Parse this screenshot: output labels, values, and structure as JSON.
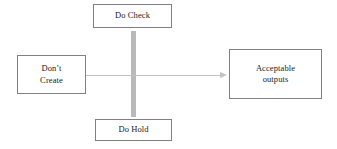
{
  "diagram": {
    "background_color": "#ffffff",
    "box_border_color": "#808080",
    "arrow_color": "#c2c2c2",
    "bar_color": "#b9b9b9",
    "nodes": {
      "top": {
        "name": "Do Check",
        "lines": [
          "Do Check"
        ]
      },
      "left": {
        "name": "Don't Create",
        "lines": [
          "Don’t",
          "Create"
        ]
      },
      "right": {
        "name": "Acceptable outputs",
        "lines": [
          "Acceptable",
          "outputs"
        ]
      },
      "bottom": {
        "name": "Do Hold",
        "lines": [
          "Do Hold"
        ]
      }
    },
    "connectors": {
      "flow_arrow": {
        "label": "",
        "from": "left",
        "to": "right",
        "direction": "right"
      },
      "vertical_bar": {
        "label": "",
        "from": "top",
        "to": "bottom",
        "direction": "vertical"
      }
    }
  }
}
